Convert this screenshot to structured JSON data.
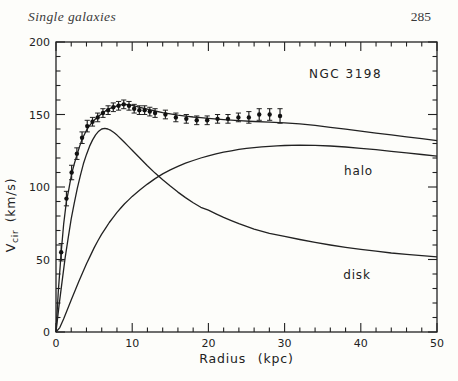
{
  "header": {
    "title": "Single galaxies",
    "page_number": "285"
  },
  "chart_data": {
    "type": "line",
    "xlabel": "Radius (kpc)",
    "ylabel": {
      "main": "V",
      "sub": "cir",
      "units": "(km/s)"
    },
    "xlim": [
      0,
      50
    ],
    "ylim": [
      0,
      200
    ],
    "x_major_ticks": [
      0,
      10,
      20,
      30,
      40,
      50
    ],
    "x_minor_step": 2,
    "y_major_ticks": [
      0,
      50,
      100,
      150,
      200
    ],
    "y_minor_step": 10,
    "grid": false,
    "frame_ticks_all_sides": true,
    "colors": {
      "ink": "#222222",
      "paper": "#fdfdfa",
      "dot": "#111111"
    },
    "annotations": [
      {
        "text": "NGC 3198",
        "x": 38.0,
        "y": 178,
        "cls": "galaxy-name",
        "letter_spacing": 1.5
      },
      {
        "text": "halo",
        "x": 39.7,
        "y": 111,
        "cls": "halo-label",
        "letter_spacing": 0.8
      },
      {
        "text": "disk",
        "x": 39.5,
        "y": 39,
        "cls": "disk-label",
        "letter_spacing": 0.8
      }
    ],
    "observed": {
      "name": "observed-rotation-curve",
      "marker": "point-with-errorbar",
      "r_kpc": [
        0.68,
        1.37,
        2.05,
        2.74,
        3.42,
        4.1,
        4.79,
        5.47,
        6.16,
        6.84,
        7.52,
        8.21,
        8.89,
        9.58,
        10.26,
        10.94,
        11.63,
        12.31,
        13,
        14.36,
        15.73,
        17.1,
        18.47,
        19.84,
        21.2,
        22.57,
        23.94,
        25.31,
        26.67,
        28.04,
        29.4
      ],
      "v_kms": [
        55,
        92,
        110,
        123,
        134,
        142,
        145,
        148,
        151,
        153,
        155,
        156,
        157,
        156,
        154,
        153,
        153,
        152,
        151,
        150,
        148,
        147,
        146,
        146,
        147,
        147,
        148,
        148,
        150,
        150,
        149
      ],
      "err_kms": [
        6,
        5,
        5,
        4,
        4,
        4,
        3,
        3,
        3,
        3,
        3,
        3,
        3,
        3,
        3,
        3,
        3,
        3,
        3,
        3,
        3,
        3,
        3,
        3,
        3,
        3,
        3,
        4,
        4,
        4,
        5
      ]
    },
    "series": [
      {
        "name": "total-model",
        "points": [
          [
            0,
            0
          ],
          [
            0.3,
            28
          ],
          [
            0.68,
            55
          ],
          [
            1,
            74
          ],
          [
            1.37,
            90
          ],
          [
            1.7,
            99
          ],
          [
            2.05,
            109
          ],
          [
            2.4,
            116
          ],
          [
            2.74,
            122
          ],
          [
            3.1,
            128
          ],
          [
            3.42,
            133
          ],
          [
            3.8,
            137
          ],
          [
            4.1,
            140
          ],
          [
            4.5,
            143
          ],
          [
            5,
            146
          ],
          [
            5.5,
            148.5
          ],
          [
            6,
            150.5
          ],
          [
            6.5,
            152.5
          ],
          [
            7,
            154
          ],
          [
            7.5,
            155
          ],
          [
            8,
            156
          ],
          [
            8.5,
            156.7
          ],
          [
            9,
            157
          ],
          [
            9.5,
            156.8
          ],
          [
            10,
            156.3
          ],
          [
            11,
            155
          ],
          [
            12,
            153.7
          ],
          [
            13,
            152.4
          ],
          [
            14,
            151.3
          ],
          [
            15,
            150.4
          ],
          [
            16,
            149.6
          ],
          [
            17,
            148.9
          ],
          [
            18,
            148.3
          ],
          [
            19,
            147.8
          ],
          [
            20,
            147.3
          ],
          [
            22,
            146.5
          ],
          [
            24,
            145.8
          ],
          [
            26,
            145.2
          ],
          [
            28,
            144.7
          ],
          [
            30,
            144.2
          ],
          [
            32,
            143.5
          ],
          [
            34,
            142.5
          ],
          [
            36,
            141.2
          ],
          [
            38,
            139.9
          ],
          [
            40,
            138.5
          ],
          [
            42,
            137.2
          ],
          [
            44,
            135.9
          ],
          [
            46,
            134.6
          ],
          [
            48,
            133.3
          ],
          [
            50,
            132
          ]
        ]
      },
      {
        "name": "halo",
        "points": [
          [
            0,
            0
          ],
          [
            0.5,
            3
          ],
          [
            1,
            9
          ],
          [
            1.5,
            15.5
          ],
          [
            2,
            22
          ],
          [
            2.5,
            28.5
          ],
          [
            3,
            35
          ],
          [
            3.5,
            41
          ],
          [
            4,
            47
          ],
          [
            4.5,
            52.5
          ],
          [
            5,
            58
          ],
          [
            5.5,
            63
          ],
          [
            6,
            67.5
          ],
          [
            6.5,
            71.5
          ],
          [
            7,
            75.5
          ],
          [
            7.5,
            79
          ],
          [
            8,
            82.5
          ],
          [
            8.5,
            85.5
          ],
          [
            9,
            88.5
          ],
          [
            9.5,
            91
          ],
          [
            10,
            93.5
          ],
          [
            11,
            98
          ],
          [
            12,
            102
          ],
          [
            13,
            105.8
          ],
          [
            14,
            109
          ],
          [
            15,
            111.8
          ],
          [
            16,
            114.2
          ],
          [
            17,
            116.4
          ],
          [
            18,
            118.3
          ],
          [
            19,
            120
          ],
          [
            20,
            121.5
          ],
          [
            21,
            122.8
          ],
          [
            22,
            124
          ],
          [
            23,
            125
          ],
          [
            24,
            125.9
          ],
          [
            25,
            126.6
          ],
          [
            26,
            127.2
          ],
          [
            27,
            127.7
          ],
          [
            28,
            128.1
          ],
          [
            29,
            128.4
          ],
          [
            30,
            128.6
          ],
          [
            32,
            128.8
          ],
          [
            34,
            128.7
          ],
          [
            36,
            128.3
          ],
          [
            38,
            127.6
          ],
          [
            40,
            126.7
          ],
          [
            42,
            125.7
          ],
          [
            44,
            124.6
          ],
          [
            46,
            123.5
          ],
          [
            48,
            122.4
          ],
          [
            50,
            121.3
          ]
        ]
      },
      {
        "name": "disk",
        "points": [
          [
            0,
            0
          ],
          [
            0.4,
            18
          ],
          [
            0.8,
            35
          ],
          [
            1.2,
            51
          ],
          [
            1.6,
            65
          ],
          [
            2,
            78
          ],
          [
            2.4,
            89
          ],
          [
            2.8,
            99
          ],
          [
            3.2,
            108
          ],
          [
            3.6,
            116
          ],
          [
            4,
            122.5
          ],
          [
            4.4,
            128
          ],
          [
            4.8,
            132.5
          ],
          [
            5.2,
            136
          ],
          [
            5.6,
            138.5
          ],
          [
            6,
            140
          ],
          [
            6.4,
            140.4
          ],
          [
            6.8,
            140
          ],
          [
            7.2,
            139
          ],
          [
            7.6,
            137.5
          ],
          [
            8,
            135.8
          ],
          [
            8.5,
            133.3
          ],
          [
            9,
            130.7
          ],
          [
            9.5,
            128
          ],
          [
            10,
            125.3
          ],
          [
            11,
            120
          ],
          [
            12,
            114.6
          ],
          [
            13,
            109.6
          ],
          [
            14,
            105
          ],
          [
            15,
            100.6
          ],
          [
            16,
            96.5
          ],
          [
            17,
            92.7
          ],
          [
            18,
            89.2
          ],
          [
            19,
            86
          ],
          [
            20,
            84
          ],
          [
            21,
            81.5
          ],
          [
            22,
            79
          ],
          [
            23,
            76.8
          ],
          [
            24,
            74.7
          ],
          [
            25,
            72.8
          ],
          [
            26,
            71
          ],
          [
            28,
            68
          ],
          [
            30,
            66
          ],
          [
            32,
            63.8
          ],
          [
            34,
            61.8
          ],
          [
            36,
            60
          ],
          [
            38,
            58.4
          ],
          [
            40,
            57
          ],
          [
            42,
            55.7
          ],
          [
            44,
            54.5
          ],
          [
            46,
            53.5
          ],
          [
            48,
            52.6
          ],
          [
            50,
            51.8
          ]
        ]
      }
    ]
  }
}
